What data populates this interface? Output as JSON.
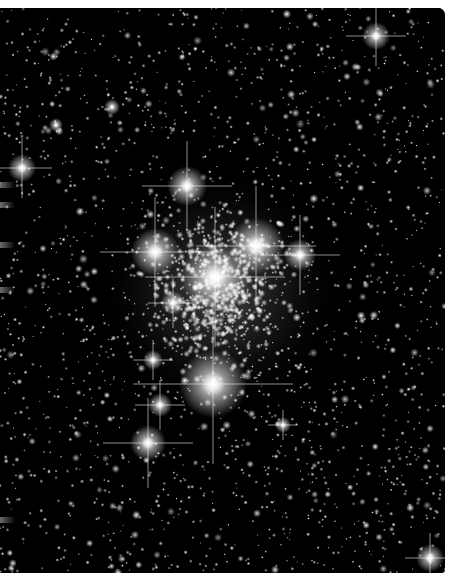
{
  "image": {
    "subject": "Star cluster",
    "description": "Dense globular-like star cluster against a black starfield with diffraction spikes on bright stars",
    "background_color": "#000000",
    "border_color": "#ffffff"
  },
  "bright_stars": [
    {
      "x": 215,
      "y": 277,
      "r": 34,
      "spike": 70
    },
    {
      "x": 256,
      "y": 246,
      "r": 28,
      "spike": 60
    },
    {
      "x": 213,
      "y": 384,
      "r": 34,
      "spike": 80
    },
    {
      "x": 155,
      "y": 252,
      "r": 24,
      "spike": 55
    },
    {
      "x": 187,
      "y": 186,
      "r": 20,
      "spike": 45
    },
    {
      "x": 300,
      "y": 255,
      "r": 16,
      "spike": 40
    },
    {
      "x": 148,
      "y": 443,
      "r": 18,
      "spike": 45
    },
    {
      "x": 376,
      "y": 36,
      "r": 14,
      "spike": 30
    },
    {
      "x": 22,
      "y": 168,
      "r": 14,
      "spike": 30
    },
    {
      "x": 160,
      "y": 405,
      "r": 12,
      "spike": 25
    },
    {
      "x": 173,
      "y": 303,
      "r": 12,
      "spike": 25
    },
    {
      "x": 430,
      "y": 558,
      "r": 14,
      "spike": 25
    },
    {
      "x": 153,
      "y": 360,
      "r": 10,
      "spike": 20
    },
    {
      "x": 283,
      "y": 425,
      "r": 8,
      "spike": 15
    },
    {
      "x": 112,
      "y": 107,
      "r": 8,
      "spike": 0
    },
    {
      "x": 56,
      "y": 125,
      "r": 7,
      "spike": 0
    }
  ],
  "cluster": {
    "cx": 220,
    "cy": 290,
    "rx": 90,
    "ry": 110,
    "count": 650
  },
  "field": {
    "count": 2000,
    "seed": 7
  }
}
